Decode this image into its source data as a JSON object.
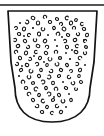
{
  "figure": {
    "background_color": "#ffffff",
    "ink_color": "#141414",
    "width": 104,
    "height": 136
  },
  "rule": {
    "name": "horizontal rule above vessel",
    "x1": 0,
    "y1": 5,
    "x2": 104,
    "y2": 5,
    "color": "#1b1b1b",
    "thickness": 1.6
  },
  "vessel": {
    "name": "vessel profile outline",
    "shape": "open bowl with straight tapering walls and rounded base",
    "rim_y": 11,
    "rim_left_x": 8,
    "rim_right_x": 97,
    "base_bottom_y": 122,
    "wall_left_bottom_x": 15,
    "wall_right_bottom_x": 90,
    "stroke_color": "#141414",
    "fill_color": "#ffffff",
    "stroke_width": 1.7,
    "path": "M 8 11 L 97 11 L 94 62 L 90 88 C 90 108 78 122 52 122 C 26 122 15 108 15 88 L 11 62 Z"
  },
  "inclusions": {
    "name": "stippled inclusion marks",
    "description": "small irregular ring, crescent and dot marks representing temper grains",
    "count": 118,
    "stroke_color": "#111111",
    "marks": [
      {
        "x": 33,
        "y": 18,
        "r": 1.9,
        "type": "ring",
        "rot": 30
      },
      {
        "x": 45,
        "y": 17,
        "r": 1.7,
        "type": "crescent",
        "rot": 120
      },
      {
        "x": 57,
        "y": 19,
        "r": 1.6,
        "type": "ring",
        "rot": 200
      },
      {
        "x": 67,
        "y": 18,
        "r": 1.8,
        "type": "crescent",
        "rot": 60
      },
      {
        "x": 76,
        "y": 20,
        "r": 1.5,
        "type": "ring",
        "rot": 310
      },
      {
        "x": 20,
        "y": 23,
        "r": 1.6,
        "type": "dot",
        "rot": 0
      },
      {
        "x": 27,
        "y": 22,
        "r": 1.8,
        "type": "crescent",
        "rot": 250
      },
      {
        "x": 38,
        "y": 23,
        "r": 2.0,
        "type": "ring",
        "rot": 90
      },
      {
        "x": 50,
        "y": 22,
        "r": 1.7,
        "type": "ring",
        "rot": 15
      },
      {
        "x": 61,
        "y": 24,
        "r": 1.6,
        "type": "crescent",
        "rot": 170
      },
      {
        "x": 71,
        "y": 23,
        "r": 1.9,
        "type": "ring",
        "rot": 280
      },
      {
        "x": 82,
        "y": 24,
        "r": 1.6,
        "type": "crescent",
        "rot": 40
      },
      {
        "x": 16,
        "y": 28,
        "r": 1.5,
        "type": "crescent",
        "rot": 200
      },
      {
        "x": 24,
        "y": 29,
        "r": 1.9,
        "type": "ring",
        "rot": 110
      },
      {
        "x": 33,
        "y": 28,
        "r": 1.7,
        "type": "dot",
        "rot": 0
      },
      {
        "x": 43,
        "y": 29,
        "r": 1.8,
        "type": "crescent",
        "rot": 330
      },
      {
        "x": 54,
        "y": 28,
        "r": 1.6,
        "type": "ring",
        "rot": 70
      },
      {
        "x": 64,
        "y": 29,
        "r": 2.0,
        "type": "ring",
        "rot": 220
      },
      {
        "x": 74,
        "y": 28,
        "r": 1.6,
        "type": "crescent",
        "rot": 140
      },
      {
        "x": 84,
        "y": 29,
        "r": 1.7,
        "type": "ring",
        "rot": 10
      },
      {
        "x": 19,
        "y": 34,
        "r": 1.7,
        "type": "ring",
        "rot": 190
      },
      {
        "x": 29,
        "y": 35,
        "r": 1.6,
        "type": "crescent",
        "rot": 80
      },
      {
        "x": 39,
        "y": 34,
        "r": 1.9,
        "type": "ring",
        "rot": 260
      },
      {
        "x": 48,
        "y": 35,
        "r": 1.5,
        "type": "dot",
        "rot": 0
      },
      {
        "x": 58,
        "y": 34,
        "r": 1.8,
        "type": "crescent",
        "rot": 150
      },
      {
        "x": 68,
        "y": 35,
        "r": 1.7,
        "type": "ring",
        "rot": 20
      },
      {
        "x": 78,
        "y": 34,
        "r": 1.6,
        "type": "crescent",
        "rot": 300
      },
      {
        "x": 87,
        "y": 35,
        "r": 1.8,
        "type": "ring",
        "rot": 100
      },
      {
        "x": 15,
        "y": 40,
        "r": 1.6,
        "type": "crescent",
        "rot": 230
      },
      {
        "x": 25,
        "y": 41,
        "r": 1.8,
        "type": "ring",
        "rot": 50
      },
      {
        "x": 35,
        "y": 40,
        "r": 1.7,
        "type": "crescent",
        "rot": 320
      },
      {
        "x": 45,
        "y": 41,
        "r": 1.9,
        "type": "ring",
        "rot": 130
      },
      {
        "x": 55,
        "y": 40,
        "r": 1.5,
        "type": "dot",
        "rot": 0
      },
      {
        "x": 65,
        "y": 41,
        "r": 1.7,
        "type": "crescent",
        "rot": 210
      },
      {
        "x": 75,
        "y": 40,
        "r": 1.8,
        "type": "ring",
        "rot": 340
      },
      {
        "x": 85,
        "y": 41,
        "r": 1.6,
        "type": "crescent",
        "rot": 90
      },
      {
        "x": 18,
        "y": 46,
        "r": 1.8,
        "type": "ring",
        "rot": 160
      },
      {
        "x": 28,
        "y": 47,
        "r": 1.6,
        "type": "crescent",
        "rot": 270
      },
      {
        "x": 38,
        "y": 46,
        "r": 1.9,
        "type": "ring",
        "rot": 30
      },
      {
        "x": 47,
        "y": 47,
        "r": 1.7,
        "type": "crescent",
        "rot": 180
      },
      {
        "x": 57,
        "y": 46,
        "r": 1.6,
        "type": "dot",
        "rot": 0
      },
      {
        "x": 67,
        "y": 47,
        "r": 1.8,
        "type": "ring",
        "rot": 250
      },
      {
        "x": 77,
        "y": 46,
        "r": 1.7,
        "type": "crescent",
        "rot": 60
      },
      {
        "x": 86,
        "y": 47,
        "r": 1.5,
        "type": "ring",
        "rot": 200
      },
      {
        "x": 16,
        "y": 52,
        "r": 1.7,
        "type": "crescent",
        "rot": 110
      },
      {
        "x": 26,
        "y": 53,
        "r": 1.9,
        "type": "ring",
        "rot": 290
      },
      {
        "x": 36,
        "y": 52,
        "r": 1.6,
        "type": "crescent",
        "rot": 40
      },
      {
        "x": 46,
        "y": 53,
        "r": 1.8,
        "type": "ring",
        "rot": 220
      },
      {
        "x": 56,
        "y": 52,
        "r": 1.7,
        "type": "crescent",
        "rot": 140
      },
      {
        "x": 66,
        "y": 53,
        "r": 1.5,
        "type": "dot",
        "rot": 0
      },
      {
        "x": 76,
        "y": 52,
        "r": 1.9,
        "type": "ring",
        "rot": 10
      },
      {
        "x": 85,
        "y": 53,
        "r": 1.6,
        "type": "crescent",
        "rot": 310
      },
      {
        "x": 20,
        "y": 58,
        "r": 1.8,
        "type": "ring",
        "rot": 70
      },
      {
        "x": 30,
        "y": 59,
        "r": 1.6,
        "type": "crescent",
        "rot": 240
      },
      {
        "x": 40,
        "y": 58,
        "r": 1.7,
        "type": "ring",
        "rot": 120
      },
      {
        "x": 50,
        "y": 59,
        "r": 1.9,
        "type": "crescent",
        "rot": 330
      },
      {
        "x": 60,
        "y": 58,
        "r": 1.6,
        "type": "ring",
        "rot": 180
      },
      {
        "x": 70,
        "y": 59,
        "r": 1.7,
        "type": "dot",
        "rot": 0
      },
      {
        "x": 80,
        "y": 58,
        "r": 1.8,
        "type": "crescent",
        "rot": 90
      },
      {
        "x": 17,
        "y": 64,
        "r": 1.6,
        "type": "crescent",
        "rot": 260
      },
      {
        "x": 27,
        "y": 65,
        "r": 1.8,
        "type": "ring",
        "rot": 20
      },
      {
        "x": 37,
        "y": 64,
        "r": 1.7,
        "type": "crescent",
        "rot": 200
      },
      {
        "x": 47,
        "y": 65,
        "r": 1.5,
        "type": "ring",
        "rot": 100
      },
      {
        "x": 57,
        "y": 64,
        "r": 1.9,
        "type": "crescent",
        "rot": 300
      },
      {
        "x": 67,
        "y": 65,
        "r": 1.6,
        "type": "ring",
        "rot": 50
      },
      {
        "x": 77,
        "y": 64,
        "r": 1.7,
        "type": "crescent",
        "rot": 230
      },
      {
        "x": 85,
        "y": 65,
        "r": 1.5,
        "type": "dot",
        "rot": 0
      },
      {
        "x": 21,
        "y": 70,
        "r": 1.7,
        "type": "ring",
        "rot": 150
      },
      {
        "x": 31,
        "y": 71,
        "r": 1.9,
        "type": "crescent",
        "rot": 340
      },
      {
        "x": 41,
        "y": 70,
        "r": 1.6,
        "type": "ring",
        "rot": 80
      },
      {
        "x": 51,
        "y": 71,
        "r": 1.8,
        "type": "crescent",
        "rot": 270
      },
      {
        "x": 61,
        "y": 70,
        "r": 1.7,
        "type": "ring",
        "rot": 30
      },
      {
        "x": 71,
        "y": 71,
        "r": 1.5,
        "type": "crescent",
        "rot": 190
      },
      {
        "x": 80,
        "y": 70,
        "r": 1.8,
        "type": "ring",
        "rot": 110
      },
      {
        "x": 19,
        "y": 76,
        "r": 1.6,
        "type": "dot",
        "rot": 0
      },
      {
        "x": 29,
        "y": 77,
        "r": 1.8,
        "type": "crescent",
        "rot": 320
      },
      {
        "x": 39,
        "y": 76,
        "r": 1.7,
        "type": "ring",
        "rot": 60
      },
      {
        "x": 49,
        "y": 77,
        "r": 1.9,
        "type": "crescent",
        "rot": 240
      },
      {
        "x": 59,
        "y": 76,
        "r": 1.6,
        "type": "ring",
        "rot": 160
      },
      {
        "x": 69,
        "y": 77,
        "r": 1.7,
        "type": "crescent",
        "rot": 10
      },
      {
        "x": 79,
        "y": 76,
        "r": 1.5,
        "type": "ring",
        "rot": 280
      },
      {
        "x": 23,
        "y": 82,
        "r": 1.8,
        "type": "crescent",
        "rot": 130
      },
      {
        "x": 33,
        "y": 83,
        "r": 1.6,
        "type": "ring",
        "rot": 350
      },
      {
        "x": 43,
        "y": 82,
        "r": 1.9,
        "type": "crescent",
        "rot": 210
      },
      {
        "x": 53,
        "y": 83,
        "r": 1.7,
        "type": "ring",
        "rot": 90
      },
      {
        "x": 63,
        "y": 82,
        "r": 1.5,
        "type": "dot",
        "rot": 0
      },
      {
        "x": 73,
        "y": 83,
        "r": 1.8,
        "type": "crescent",
        "rot": 300
      },
      {
        "x": 81,
        "y": 82,
        "r": 1.6,
        "type": "ring",
        "rot": 40
      },
      {
        "x": 26,
        "y": 88,
        "r": 1.7,
        "type": "ring",
        "rot": 180
      },
      {
        "x": 36,
        "y": 89,
        "r": 1.9,
        "type": "crescent",
        "rot": 70
      },
      {
        "x": 46,
        "y": 88,
        "r": 1.6,
        "type": "ring",
        "rot": 250
      },
      {
        "x": 56,
        "y": 89,
        "r": 1.8,
        "type": "crescent",
        "rot": 140
      },
      {
        "x": 66,
        "y": 88,
        "r": 1.7,
        "type": "ring",
        "rot": 20
      },
      {
        "x": 76,
        "y": 89,
        "r": 1.5,
        "type": "crescent",
        "rot": 330
      },
      {
        "x": 29,
        "y": 94,
        "r": 1.8,
        "type": "crescent",
        "rot": 100
      },
      {
        "x": 39,
        "y": 95,
        "r": 1.6,
        "type": "ring",
        "rot": 290
      },
      {
        "x": 49,
        "y": 94,
        "r": 1.9,
        "type": "crescent",
        "rot": 200
      },
      {
        "x": 59,
        "y": 95,
        "r": 1.7,
        "type": "ring",
        "rot": 50
      },
      {
        "x": 69,
        "y": 94,
        "r": 1.5,
        "type": "dot",
        "rot": 0
      },
      {
        "x": 33,
        "y": 100,
        "r": 1.7,
        "type": "ring",
        "rot": 230
      },
      {
        "x": 43,
        "y": 101,
        "r": 1.8,
        "type": "crescent",
        "rot": 30
      },
      {
        "x": 53,
        "y": 100,
        "r": 1.6,
        "type": "ring",
        "rot": 160
      },
      {
        "x": 63,
        "y": 101,
        "r": 1.9,
        "type": "crescent",
        "rot": 310
      },
      {
        "x": 71,
        "y": 100,
        "r": 1.6,
        "type": "ring",
        "rot": 80
      },
      {
        "x": 37,
        "y": 106,
        "r": 1.8,
        "type": "crescent",
        "rot": 270
      },
      {
        "x": 47,
        "y": 107,
        "r": 1.6,
        "type": "ring",
        "rot": 120
      },
      {
        "x": 57,
        "y": 106,
        "r": 1.7,
        "type": "crescent",
        "rot": 10
      },
      {
        "x": 66,
        "y": 107,
        "r": 1.5,
        "type": "dot",
        "rot": 0
      },
      {
        "x": 42,
        "y": 112,
        "r": 1.7,
        "type": "ring",
        "rot": 190
      },
      {
        "x": 52,
        "y": 113,
        "r": 1.6,
        "type": "crescent",
        "rot": 60
      },
      {
        "x": 61,
        "y": 112,
        "r": 1.8,
        "type": "ring",
        "rot": 300
      },
      {
        "x": 24,
        "y": 36,
        "r": 1.4,
        "type": "dot",
        "rot": 0
      },
      {
        "x": 62,
        "y": 37,
        "r": 1.4,
        "type": "dot",
        "rot": 0
      },
      {
        "x": 34,
        "y": 56,
        "r": 1.4,
        "type": "dot",
        "rot": 0
      },
      {
        "x": 72,
        "y": 50,
        "r": 1.4,
        "type": "dot",
        "rot": 0
      },
      {
        "x": 22,
        "y": 66,
        "r": 1.4,
        "type": "dot",
        "rot": 0
      },
      {
        "x": 54,
        "y": 97,
        "r": 1.4,
        "type": "dot",
        "rot": 0
      },
      {
        "x": 44,
        "y": 62,
        "r": 1.4,
        "type": "dot",
        "rot": 0
      },
      {
        "x": 84,
        "y": 40,
        "r": 1.4,
        "type": "dot",
        "rot": 0
      }
    ]
  }
}
